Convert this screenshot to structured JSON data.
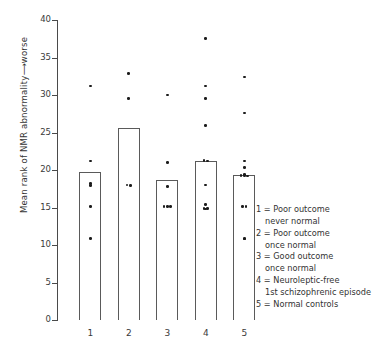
{
  "chart_data": {
    "type": "bar",
    "title": "",
    "xlabel": "",
    "ylabel": "Mean rank of NMR abnormality⟶worse",
    "ylim": [
      0,
      40
    ],
    "ytick_values": [
      0,
      5,
      10,
      15,
      20,
      25,
      30,
      35,
      40
    ],
    "ytick_labels": [
      "0",
      "5",
      "10",
      "15",
      "20",
      "25",
      "30",
      "35",
      "40"
    ],
    "grid": false,
    "legend_position": "right-bottom",
    "categories": [
      "1",
      "2",
      "3",
      "4",
      "5"
    ],
    "values": [
      19.7,
      25.6,
      18.7,
      21.2,
      19.3
    ],
    "series": [
      {
        "name": "Mean rank",
        "values": [
          19.7,
          25.6,
          18.7,
          21.2,
          19.3
        ]
      }
    ],
    "overlay": {
      "type": "scatter",
      "name": "Individual subjects",
      "points_by_category": {
        "1": [
          31.2,
          21.2,
          18.2,
          17.9,
          15.1,
          10.9
        ],
        "2": [
          32.9,
          29.5,
          18.0,
          17.9
        ],
        "3": [
          30.0,
          21.0,
          17.8,
          15.1,
          15.1,
          15.1
        ],
        "4": [
          37.5,
          31.2,
          29.5,
          25.9,
          21.3,
          21.2,
          18.0,
          15.4,
          14.9,
          14.9,
          14.8
        ],
        "5": [
          32.4,
          27.6,
          21.2,
          20.3,
          19.4,
          19.3,
          19.3,
          19.2,
          15.1,
          15.1,
          10.9,
          10.8
        ]
      }
    },
    "annotations": []
  },
  "legend": {
    "items": [
      {
        "key": "1",
        "separator": "=",
        "line1": "Poor outcome",
        "line2": "never normal"
      },
      {
        "key": "2",
        "separator": "=",
        "line1": "Poor outcome",
        "line2": "once normal"
      },
      {
        "key": "3",
        "separator": "=",
        "line1": "Good outcome",
        "line2": "once normal"
      },
      {
        "key": "4",
        "separator": "=",
        "line1": "Neuroleptic-free",
        "line2": "1st schizophrenic episode"
      },
      {
        "key": "5",
        "separator": "=",
        "line1": "Normal controls",
        "line2": ""
      }
    ],
    "rendered": [
      "1 = Poor outcome",
      "never normal",
      "2 = Poor outcome",
      "once normal",
      "3 = Good outcome",
      "once normal",
      "4 = Neuroleptic-free",
      "1st schizophrenic episode",
      "5 = Normal controls"
    ]
  },
  "colors": {
    "axis": "#4a4a4a",
    "bar_stroke": "#5a5a5a",
    "bar_fill": "#ffffff",
    "dot": "#1c1c1c",
    "text": "#333333",
    "background": "#ffffff"
  }
}
